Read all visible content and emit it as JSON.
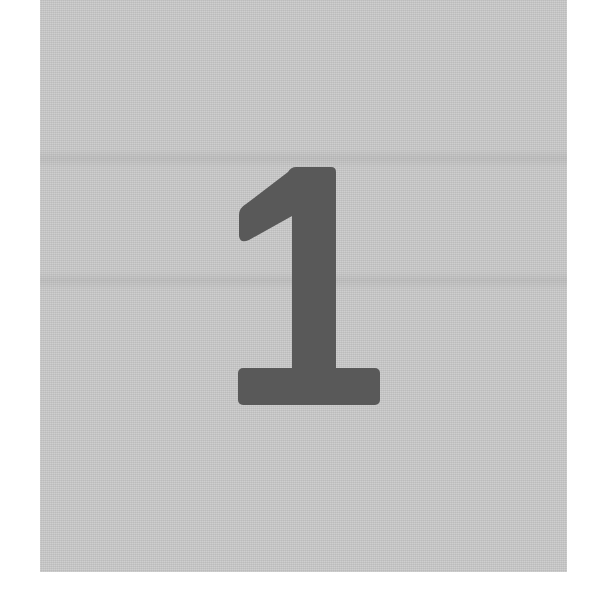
{
  "figure": {
    "numeral": "1",
    "colors": {
      "page_background": "#ffffff",
      "panel_background": "#c9c9c9",
      "numeral_fill": "#595959"
    }
  }
}
